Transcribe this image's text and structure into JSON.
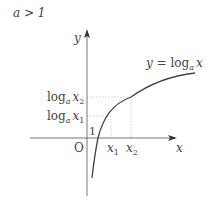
{
  "condition": "a > 1",
  "axes": {
    "x_label": "x",
    "y_label": "y",
    "origin_label": "O"
  },
  "curve": {
    "label_prefix": "y = log",
    "label_sub": "a",
    "label_var": "x"
  },
  "markers": {
    "y_intercept_label": "1",
    "x1": {
      "var": "x",
      "sub": "1"
    },
    "x2": {
      "var": "x",
      "sub": "2"
    },
    "logx1": {
      "fn": "log",
      "base": "a",
      "var": "x",
      "sub": "1"
    },
    "logx2": {
      "fn": "log",
      "base": "a",
      "var": "x",
      "sub": "2"
    }
  },
  "colors": {
    "axis": "#555555",
    "curve": "#444444",
    "guide": "#bbbbbb",
    "text": "#444444"
  }
}
